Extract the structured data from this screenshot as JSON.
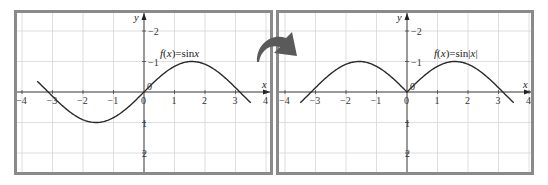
{
  "chart_data": [
    {
      "type": "line",
      "title": "f(x) = sin x",
      "xlabel": "x",
      "ylabel": "y",
      "xlim": [
        -4.2,
        4.2
      ],
      "ylim": [
        -2.6,
        2.6
      ],
      "x_ticks": [
        -4,
        -3,
        -2,
        -1,
        0,
        1,
        2,
        3,
        4
      ],
      "y_ticks": [
        -2,
        -1,
        1,
        2
      ],
      "grid": true,
      "series": [
        {
          "name": "f(x)=sin x",
          "function": "sin(x)",
          "x_range": [
            -3.5,
            3.5
          ],
          "x": [
            -3.5,
            -3,
            -2.5,
            -2,
            -1.5708,
            -1,
            -0.5,
            0,
            0.5,
            1,
            1.5708,
            2,
            2.5,
            3,
            3.5
          ],
          "y": [
            0.35,
            -0.14,
            -0.6,
            -0.91,
            -1,
            -0.84,
            -0.48,
            0,
            0.48,
            0.84,
            1,
            0.91,
            0.6,
            0.14,
            -0.35
          ]
        }
      ]
    },
    {
      "type": "line",
      "title": "f(x) = sin|x|",
      "xlabel": "x",
      "ylabel": "y",
      "xlim": [
        -4.2,
        4.2
      ],
      "ylim": [
        -2.6,
        2.6
      ],
      "x_ticks": [
        -4,
        -3,
        -2,
        -1,
        0,
        1,
        2,
        3,
        4
      ],
      "y_ticks": [
        -2,
        -1,
        1,
        2
      ],
      "grid": true,
      "series": [
        {
          "name": "f(x)=sin|x|",
          "function": "sin(abs(x))",
          "x_range": [
            -3.5,
            3.5
          ],
          "x": [
            -3.5,
            -3,
            -2.5,
            -2,
            -1.5708,
            -1,
            -0.5,
            0,
            0.5,
            1,
            1.5708,
            2,
            2.5,
            3,
            3.5
          ],
          "y": [
            -0.35,
            0.14,
            0.6,
            0.91,
            1,
            0.84,
            0.48,
            0,
            0.48,
            0.84,
            1,
            0.91,
            0.6,
            0.14,
            -0.35
          ]
        }
      ]
    }
  ],
  "panels": [
    {
      "label": "f(x) = sin x",
      "fn_text": "f(x)",
      "fn_eq": "=",
      "fn_rhs": "sin x",
      "x_axis_label": "x",
      "y_axis_label": "y",
      "origin_label": "0",
      "x_tick_labels": [
        "−4",
        "−3",
        "−2",
        "−1",
        "0",
        "1",
        "2",
        "3",
        "4"
      ],
      "y_tick_labels": [
        "2",
        "1",
        "−1",
        "−2"
      ]
    },
    {
      "label": "f(x) = sin|x|",
      "fn_text": "f(x)",
      "fn_eq": "=",
      "fn_rhs": "sin|x|",
      "x_axis_label": "x",
      "y_axis_label": "y",
      "origin_label": "0",
      "x_tick_labels": [
        "−4",
        "−3",
        "−2",
        "−1",
        "0",
        "1",
        "2",
        "3",
        "4"
      ],
      "y_tick_labels": [
        "2",
        "1",
        "−1",
        "−2"
      ]
    }
  ],
  "transition_arrow": "curved-arrow-right",
  "colors": {
    "frame": "#8a8a8a",
    "grid": "#d6d6d6",
    "curve": "#2a2a2a",
    "arrow": "#5a5a5a"
  }
}
